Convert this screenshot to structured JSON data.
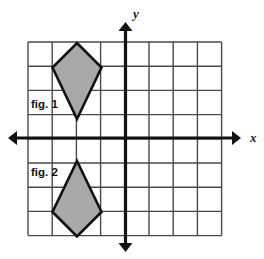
{
  "diagram": {
    "background_color": "#ffffff",
    "grid": {
      "color": "#4a4a4a",
      "line_width": 1.4,
      "cell_size": 24.2,
      "columns": 8,
      "rows": 8,
      "left": 28,
      "top": 42,
      "right": 221.6,
      "bottom": 235.6
    },
    "axes": {
      "color": "#111111",
      "line_width": 3.2,
      "x_axis": {
        "label": "x",
        "y_position": 138,
        "start_x": 8,
        "end_x": 241,
        "label_x": 250,
        "label_y": 142,
        "arrow_left": true,
        "arrow_right": true
      },
      "y_axis": {
        "label": "y",
        "x_position": 125.5,
        "start_y": 22,
        "end_y": 252,
        "label_x": 133,
        "label_y": 18,
        "arrow_up": true,
        "arrow_down": true
      }
    },
    "shapes": [
      {
        "name": "fig-1-kite",
        "label": "fig. 1",
        "fill_color": "#a8a8a8",
        "stroke_color": "#111111",
        "stroke_width": 2.6,
        "orientation": "point-down",
        "points": "77,43 101.5,67.5 77,119 52.5,67.5",
        "vertices": [
          {
            "x": 77,
            "y": 43
          },
          {
            "x": 101.5,
            "y": 67.5
          },
          {
            "x": 77,
            "y": 119
          },
          {
            "x": 52.5,
            "y": 67.5
          }
        ],
        "label_x": 31,
        "label_y": 108
      },
      {
        "name": "fig-2-kite",
        "label": "fig. 2",
        "fill_color": "#a8a8a8",
        "stroke_color": "#111111",
        "stroke_width": 2.6,
        "orientation": "point-up",
        "points": "77,161 101.5,212 77,236.5 52.5,212",
        "vertices": [
          {
            "x": 77,
            "y": 161
          },
          {
            "x": 101.5,
            "y": 212
          },
          {
            "x": 77,
            "y": 236.5
          },
          {
            "x": 52.5,
            "y": 212
          }
        ],
        "label_x": 31,
        "label_y": 176
      }
    ]
  }
}
